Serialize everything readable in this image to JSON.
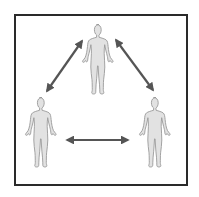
{
  "diagram": {
    "type": "relationship-triangle",
    "colors": {
      "frame": "#2a2a2a",
      "figure_fill": "#e2e2e2",
      "figure_stroke": "#9a9a9a",
      "arrow": "#555555",
      "background": "#ffffff"
    },
    "nodes": [
      {
        "id": "person-top",
        "shape": "human-figure",
        "cx": 99,
        "top": 24
      },
      {
        "id": "person-left",
        "shape": "human-figure",
        "cx": 42,
        "top": 96
      },
      {
        "id": "person-right",
        "shape": "human-figure",
        "cx": 156,
        "top": 96
      }
    ],
    "edges": [
      {
        "from": "person-top",
        "to": "person-left",
        "style": "double-arrow",
        "x1": 82,
        "y1": 41,
        "x2": 47,
        "y2": 91
      },
      {
        "from": "person-top",
        "to": "person-right",
        "style": "double-arrow",
        "x1": 116,
        "y1": 40,
        "x2": 153,
        "y2": 90
      },
      {
        "from": "person-left",
        "to": "person-right",
        "style": "double-arrow",
        "x1": 67,
        "y1": 140,
        "x2": 128,
        "y2": 140
      }
    ]
  }
}
